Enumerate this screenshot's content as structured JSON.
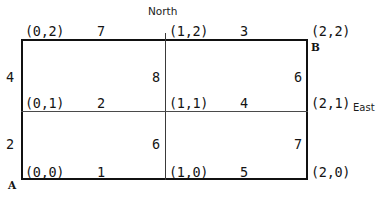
{
  "figure": {
    "kind": "grid-network-diagram",
    "ink_color": "#141414",
    "rule_color": "#111111"
  },
  "compass": {
    "north_label": "North",
    "east_label": "East"
  },
  "terminals": {
    "source_label": "A",
    "sink_label": "B"
  },
  "nodes": [
    {
      "id": "n02",
      "label": "(0,2)",
      "x": 0,
      "y": 2
    },
    {
      "id": "n12",
      "label": "(1,2)",
      "x": 1,
      "y": 2
    },
    {
      "id": "n22",
      "label": "(2,2)",
      "x": 2,
      "y": 2
    },
    {
      "id": "n01",
      "label": "(0,1)",
      "x": 0,
      "y": 1
    },
    {
      "id": "n11",
      "label": "(1,1)",
      "x": 1,
      "y": 1
    },
    {
      "id": "n21",
      "label": "(2,1)",
      "x": 2,
      "y": 1
    },
    {
      "id": "n00",
      "label": "(0,0)",
      "x": 0,
      "y": 0
    },
    {
      "id": "n10",
      "label": "(1,0)",
      "x": 1,
      "y": 0
    },
    {
      "id": "n20",
      "label": "(2,0)",
      "x": 2,
      "y": 0
    }
  ],
  "edges": [
    {
      "id": "e7",
      "weight": "7",
      "orientation": "horizontal",
      "from": "(0,2)",
      "to": "(1,2)"
    },
    {
      "id": "e3",
      "weight": "3",
      "orientation": "horizontal",
      "from": "(1,2)",
      "to": "(2,2)"
    },
    {
      "id": "e2h",
      "weight": "2",
      "orientation": "horizontal",
      "from": "(0,1)",
      "to": "(1,1)"
    },
    {
      "id": "e4h",
      "weight": "4",
      "orientation": "horizontal",
      "from": "(1,1)",
      "to": "(2,1)"
    },
    {
      "id": "e1",
      "weight": "1",
      "orientation": "horizontal",
      "from": "(0,0)",
      "to": "(1,0)"
    },
    {
      "id": "e5",
      "weight": "5",
      "orientation": "horizontal",
      "from": "(1,0)",
      "to": "(2,0)"
    },
    {
      "id": "e4v",
      "weight": "4",
      "orientation": "vertical",
      "from": "(0,1)",
      "to": "(0,2)"
    },
    {
      "id": "e2v",
      "weight": "2",
      "orientation": "vertical",
      "from": "(0,0)",
      "to": "(0,1)"
    },
    {
      "id": "e8",
      "weight": "8",
      "orientation": "vertical",
      "from": "(1,1)",
      "to": "(1,2)"
    },
    {
      "id": "e6a",
      "weight": "6",
      "orientation": "vertical",
      "from": "(1,0)",
      "to": "(1,1)"
    },
    {
      "id": "e6b",
      "weight": "6",
      "orientation": "vertical",
      "from": "(2,1)",
      "to": "(2,2)"
    },
    {
      "id": "e7v",
      "weight": "7",
      "orientation": "vertical",
      "from": "(2,0)",
      "to": "(2,1)"
    }
  ]
}
